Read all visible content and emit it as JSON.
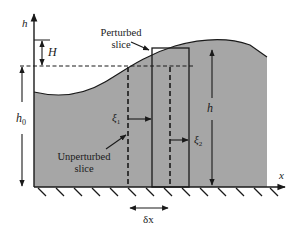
{
  "diagram": {
    "axes": {
      "vertical_label": "h",
      "horizontal_label": "x"
    },
    "labels": {
      "H": "H",
      "h0": "h",
      "h0_sub": "0",
      "h": "h",
      "xi1": "ξ",
      "xi1_sub": "1",
      "xi2": "ξ",
      "xi2_sub": "2",
      "delta_x": "δx",
      "perturbed_line1": "Perturbed",
      "perturbed_line2": "slice",
      "unperturbed_line1": "Unperturbed",
      "unperturbed_line2": "slice"
    },
    "colors": {
      "fluid": "#a6a6a6",
      "line": "#1a1a1a",
      "background": "#ffffff"
    }
  }
}
